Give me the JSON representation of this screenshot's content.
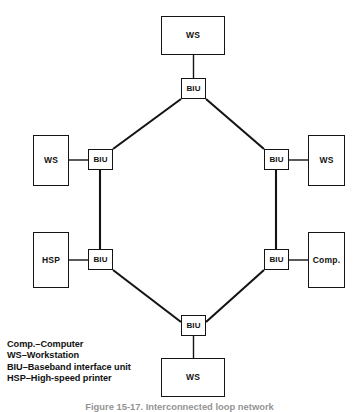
{
  "figure": {
    "caption": "Figure 15-17.  Interconnected loop network",
    "background_color": "#ffffff",
    "line_color": "#141414"
  },
  "diagram": {
    "type": "network-topology",
    "title": "Interconnected loop network",
    "nodes": [
      {
        "id": "ws-top",
        "label": "WS",
        "kind": "device",
        "x": 161,
        "y": 16,
        "w": 64,
        "h": 39
      },
      {
        "id": "biu-top",
        "label": "BIU",
        "kind": "biu",
        "x": 181,
        "y": 78,
        "w": 25,
        "h": 21
      },
      {
        "id": "ws-left",
        "label": "WS",
        "kind": "device",
        "x": 33,
        "y": 135,
        "w": 36,
        "h": 51
      },
      {
        "id": "biu-left-upper",
        "label": "BIU",
        "kind": "biu",
        "x": 88,
        "y": 149,
        "w": 25,
        "h": 21
      },
      {
        "id": "biu-right-upper",
        "label": "BIU",
        "kind": "biu",
        "x": 264,
        "y": 149,
        "w": 25,
        "h": 21
      },
      {
        "id": "ws-right",
        "label": "WS",
        "kind": "device",
        "x": 308,
        "y": 135,
        "w": 37,
        "h": 51
      },
      {
        "id": "hsp-left",
        "label": "HSP",
        "kind": "device",
        "x": 33,
        "y": 232,
        "w": 36,
        "h": 56
      },
      {
        "id": "biu-left-lower",
        "label": "BIU",
        "kind": "biu",
        "x": 88,
        "y": 249,
        "w": 25,
        "h": 21
      },
      {
        "id": "biu-right-lower",
        "label": "BIU",
        "kind": "biu",
        "x": 264,
        "y": 249,
        "w": 25,
        "h": 21
      },
      {
        "id": "comp-right",
        "label": "Comp.",
        "kind": "device",
        "x": 308,
        "y": 232,
        "w": 37,
        "h": 56
      },
      {
        "id": "biu-bottom",
        "label": "BIU",
        "kind": "biu",
        "x": 181,
        "y": 315,
        "w": 25,
        "h": 21
      },
      {
        "id": "ws-bottom",
        "label": "WS",
        "kind": "device",
        "x": 161,
        "y": 358,
        "w": 64,
        "h": 39
      }
    ],
    "links": [
      {
        "id": "link-ws-top-biu-top",
        "from": "ws-top",
        "to": "biu-top",
        "style": "stub",
        "x1": 193.5,
        "y1": 55,
        "x2": 193.5,
        "y2": 78
      },
      {
        "id": "link-biu-top-biu-left",
        "from": "biu-top",
        "to": "biu-left-upper",
        "style": "trunk",
        "x1": 181,
        "y1": 99,
        "x2": 113,
        "y2": 149
      },
      {
        "id": "link-biu-top-biu-right",
        "from": "biu-top",
        "to": "biu-right-upper",
        "style": "trunk",
        "x1": 206,
        "y1": 99,
        "x2": 264,
        "y2": 149
      },
      {
        "id": "link-ws-left-biu",
        "from": "ws-left",
        "to": "biu-left-upper",
        "style": "stub",
        "x1": 69,
        "y1": 160,
        "x2": 88,
        "y2": 160
      },
      {
        "id": "link-ws-right-biu",
        "from": "biu-right-upper",
        "to": "ws-right",
        "style": "stub",
        "x1": 289,
        "y1": 160,
        "x2": 308,
        "y2": 160
      },
      {
        "id": "link-biu-left-vertical",
        "from": "biu-left-upper",
        "to": "biu-left-lower",
        "style": "trunk",
        "x1": 100,
        "y1": 170,
        "x2": 100,
        "y2": 249
      },
      {
        "id": "link-biu-right-vertical",
        "from": "biu-right-upper",
        "to": "biu-right-lower",
        "style": "trunk",
        "x1": 276,
        "y1": 170,
        "x2": 276,
        "y2": 249
      },
      {
        "id": "link-hsp-biu",
        "from": "hsp-left",
        "to": "biu-left-lower",
        "style": "stub",
        "x1": 69,
        "y1": 260,
        "x2": 88,
        "y2": 260
      },
      {
        "id": "link-comp-biu",
        "from": "biu-right-lower",
        "to": "comp-right",
        "style": "stub",
        "x1": 289,
        "y1": 260,
        "x2": 308,
        "y2": 260
      },
      {
        "id": "link-biu-left-biu-bottom",
        "from": "biu-left-lower",
        "to": "biu-bottom",
        "style": "trunk",
        "x1": 113,
        "y1": 270,
        "x2": 181,
        "y2": 322
      },
      {
        "id": "link-biu-right-biu-bottom",
        "from": "biu-right-lower",
        "to": "biu-bottom",
        "style": "trunk",
        "x1": 264,
        "y1": 270,
        "x2": 206,
        "y2": 322
      },
      {
        "id": "link-biu-bottom-ws-bottom",
        "from": "biu-bottom",
        "to": "ws-bottom",
        "style": "stub",
        "x1": 193.5,
        "y1": 336,
        "x2": 193.5,
        "y2": 358
      }
    ]
  },
  "legend": {
    "lines": [
      "Comp.–Computer",
      "WS–Workstation",
      "BIU–Baseband interface unit",
      "HSP–High-speed printer"
    ]
  }
}
